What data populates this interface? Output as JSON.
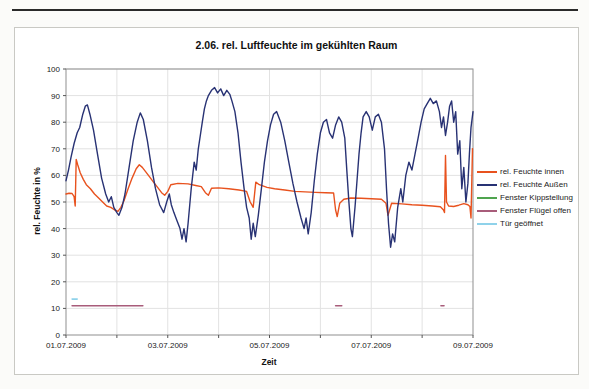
{
  "figure": {
    "top_rule": "divider"
  },
  "chart_data": {
    "type": "line",
    "title": "2.06. rel. Luftfeuchte im gekühlten Raum",
    "xlabel": "Zeit",
    "ylabel": "rel. Feuchte in %",
    "x_unit": "days since 01.07.2009 00:00",
    "xlim": [
      0,
      8
    ],
    "ylim": [
      0,
      100
    ],
    "grid": true,
    "legend_position": "right",
    "x_tick_labels": [
      "01.07.2009",
      "03.07.2009",
      "05.07.2009",
      "07.07.2009",
      "09.07.2009"
    ],
    "x_tick_days": [
      0,
      2,
      4,
      6,
      8
    ],
    "y_tick_labels": [
      "0",
      "10",
      "20",
      "30",
      "40",
      "50",
      "60",
      "70",
      "80",
      "90",
      "100"
    ],
    "y_tick_values": [
      0,
      10,
      20,
      30,
      40,
      50,
      60,
      70,
      80,
      90,
      100
    ],
    "colors": {
      "grid": "#e2e2e2",
      "plot_border": "#8f8f8f",
      "tick": "#555555"
    },
    "series": [
      {
        "name": "rel. Feuchte innen",
        "color": "#e8521e",
        "points": [
          [
            0.0,
            53
          ],
          [
            0.06,
            53.3
          ],
          [
            0.12,
            53.2
          ],
          [
            0.16,
            52
          ],
          [
            0.18,
            48.5
          ],
          [
            0.2,
            66
          ],
          [
            0.23,
            64
          ],
          [
            0.28,
            61
          ],
          [
            0.34,
            58.5
          ],
          [
            0.4,
            56.5
          ],
          [
            0.48,
            55
          ],
          [
            0.56,
            53
          ],
          [
            0.64,
            51.5
          ],
          [
            0.72,
            50
          ],
          [
            0.8,
            48.5
          ],
          [
            0.88,
            48
          ],
          [
            0.96,
            47
          ],
          [
            1.02,
            46.5
          ],
          [
            1.08,
            48
          ],
          [
            1.14,
            50.5
          ],
          [
            1.22,
            55
          ],
          [
            1.3,
            59
          ],
          [
            1.38,
            62.5
          ],
          [
            1.44,
            64
          ],
          [
            1.5,
            63
          ],
          [
            1.56,
            61.5
          ],
          [
            1.64,
            59.5
          ],
          [
            1.72,
            57.5
          ],
          [
            1.8,
            55.5
          ],
          [
            1.88,
            53.5
          ],
          [
            1.94,
            52.5
          ],
          [
            2.0,
            54
          ],
          [
            2.06,
            56.5
          ],
          [
            2.2,
            57
          ],
          [
            2.4,
            56.8
          ],
          [
            2.55,
            56.2
          ],
          [
            2.66,
            55.8
          ],
          [
            2.74,
            53.5
          ],
          [
            2.8,
            52.5
          ],
          [
            2.86,
            55.2
          ],
          [
            3.0,
            55.3
          ],
          [
            3.2,
            55
          ],
          [
            3.4,
            54.5
          ],
          [
            3.55,
            54
          ],
          [
            3.62,
            50
          ],
          [
            3.68,
            48
          ],
          [
            3.73,
            57.5
          ],
          [
            3.8,
            56.5
          ],
          [
            3.95,
            55.5
          ],
          [
            4.1,
            55
          ],
          [
            4.3,
            54.5
          ],
          [
            4.5,
            54
          ],
          [
            4.7,
            53.8
          ],
          [
            4.9,
            53.6
          ],
          [
            5.1,
            53.5
          ],
          [
            5.26,
            53.4
          ],
          [
            5.3,
            47
          ],
          [
            5.33,
            44.5
          ],
          [
            5.38,
            49.5
          ],
          [
            5.46,
            51
          ],
          [
            5.6,
            51.5
          ],
          [
            5.8,
            51.4
          ],
          [
            6.0,
            51.2
          ],
          [
            6.2,
            51
          ],
          [
            6.29,
            49.5
          ],
          [
            6.33,
            45
          ],
          [
            6.4,
            49.5
          ],
          [
            6.6,
            49.3
          ],
          [
            6.8,
            49
          ],
          [
            7.0,
            48.8
          ],
          [
            7.2,
            48.5
          ],
          [
            7.36,
            48.2
          ],
          [
            7.42,
            47
          ],
          [
            7.44,
            46
          ],
          [
            7.46,
            67.5
          ],
          [
            7.48,
            50
          ],
          [
            7.52,
            48.5
          ],
          [
            7.62,
            48.3
          ],
          [
            7.72,
            48.8
          ],
          [
            7.82,
            49.4
          ],
          [
            7.9,
            49
          ],
          [
            7.94,
            48.3
          ],
          [
            7.96,
            44
          ],
          [
            7.99,
            70
          ]
        ]
      },
      {
        "name": "rel. Feuchte Außen",
        "color": "#283274",
        "points": [
          [
            0.0,
            58
          ],
          [
            0.05,
            62
          ],
          [
            0.1,
            67
          ],
          [
            0.16,
            72
          ],
          [
            0.22,
            76
          ],
          [
            0.27,
            78
          ],
          [
            0.33,
            83
          ],
          [
            0.38,
            86
          ],
          [
            0.42,
            86.5
          ],
          [
            0.47,
            83
          ],
          [
            0.54,
            77
          ],
          [
            0.62,
            68
          ],
          [
            0.7,
            59
          ],
          [
            0.78,
            53
          ],
          [
            0.84,
            50
          ],
          [
            0.89,
            52
          ],
          [
            0.94,
            48
          ],
          [
            1.0,
            46
          ],
          [
            1.04,
            45
          ],
          [
            1.1,
            48
          ],
          [
            1.16,
            53
          ],
          [
            1.24,
            63
          ],
          [
            1.32,
            73
          ],
          [
            1.4,
            80
          ],
          [
            1.46,
            83.5
          ],
          [
            1.52,
            81
          ],
          [
            1.6,
            73
          ],
          [
            1.68,
            63
          ],
          [
            1.76,
            55
          ],
          [
            1.84,
            49
          ],
          [
            1.92,
            46
          ],
          [
            1.98,
            50
          ],
          [
            2.03,
            53
          ],
          [
            2.07,
            49
          ],
          [
            2.12,
            46
          ],
          [
            2.18,
            43
          ],
          [
            2.24,
            40
          ],
          [
            2.28,
            36
          ],
          [
            2.32,
            40
          ],
          [
            2.36,
            35
          ],
          [
            2.4,
            42
          ],
          [
            2.46,
            55
          ],
          [
            2.52,
            65
          ],
          [
            2.56,
            62
          ],
          [
            2.6,
            70
          ],
          [
            2.64,
            75
          ],
          [
            2.68,
            80
          ],
          [
            2.72,
            85
          ],
          [
            2.76,
            88
          ],
          [
            2.8,
            90
          ],
          [
            2.86,
            92
          ],
          [
            2.92,
            93
          ],
          [
            2.98,
            91
          ],
          [
            3.04,
            92.5
          ],
          [
            3.1,
            90
          ],
          [
            3.16,
            92
          ],
          [
            3.22,
            90.5
          ],
          [
            3.26,
            88
          ],
          [
            3.32,
            84
          ],
          [
            3.38,
            76
          ],
          [
            3.44,
            65
          ],
          [
            3.5,
            55
          ],
          [
            3.55,
            48
          ],
          [
            3.6,
            44
          ],
          [
            3.64,
            36
          ],
          [
            3.68,
            42
          ],
          [
            3.72,
            37
          ],
          [
            3.78,
            45
          ],
          [
            3.84,
            55
          ],
          [
            3.9,
            65
          ],
          [
            3.96,
            73
          ],
          [
            4.02,
            79
          ],
          [
            4.08,
            83
          ],
          [
            4.14,
            84
          ],
          [
            4.22,
            80
          ],
          [
            4.3,
            73
          ],
          [
            4.38,
            65
          ],
          [
            4.46,
            57
          ],
          [
            4.54,
            50
          ],
          [
            4.62,
            44
          ],
          [
            4.68,
            40
          ],
          [
            4.72,
            44
          ],
          [
            4.76,
            38
          ],
          [
            4.82,
            46
          ],
          [
            4.88,
            58
          ],
          [
            4.94,
            68
          ],
          [
            5.0,
            76
          ],
          [
            5.06,
            80
          ],
          [
            5.12,
            81
          ],
          [
            5.18,
            76
          ],
          [
            5.24,
            74
          ],
          [
            5.3,
            79
          ],
          [
            5.36,
            82
          ],
          [
            5.42,
            80
          ],
          [
            5.48,
            74
          ],
          [
            5.52,
            62
          ],
          [
            5.56,
            50
          ],
          [
            5.6,
            40
          ],
          [
            5.63,
            37
          ],
          [
            5.68,
            48
          ],
          [
            5.72,
            58
          ],
          [
            5.76,
            68
          ],
          [
            5.8,
            76
          ],
          [
            5.84,
            82
          ],
          [
            5.9,
            84
          ],
          [
            5.96,
            82
          ],
          [
            6.02,
            77
          ],
          [
            6.08,
            82
          ],
          [
            6.14,
            83
          ],
          [
            6.2,
            80
          ],
          [
            6.26,
            70
          ],
          [
            6.3,
            55
          ],
          [
            6.34,
            42
          ],
          [
            6.38,
            33
          ],
          [
            6.42,
            38
          ],
          [
            6.46,
            35
          ],
          [
            6.52,
            48
          ],
          [
            6.58,
            55
          ],
          [
            6.62,
            50
          ],
          [
            6.68,
            60
          ],
          [
            6.74,
            65
          ],
          [
            6.8,
            62
          ],
          [
            6.86,
            68
          ],
          [
            6.92,
            74
          ],
          [
            6.98,
            80
          ],
          [
            7.04,
            85
          ],
          [
            7.1,
            87
          ],
          [
            7.16,
            89
          ],
          [
            7.22,
            87
          ],
          [
            7.28,
            88
          ],
          [
            7.34,
            84
          ],
          [
            7.38,
            78
          ],
          [
            7.42,
            82
          ],
          [
            7.46,
            75
          ],
          [
            7.5,
            80
          ],
          [
            7.54,
            86
          ],
          [
            7.58,
            88
          ],
          [
            7.62,
            80
          ],
          [
            7.66,
            84
          ],
          [
            7.7,
            68
          ],
          [
            7.74,
            73
          ],
          [
            7.78,
            55
          ],
          [
            7.82,
            63
          ],
          [
            7.86,
            50
          ],
          [
            7.9,
            57
          ],
          [
            7.93,
            68
          ],
          [
            7.96,
            78
          ],
          [
            8.0,
            84
          ]
        ]
      },
      {
        "name": "Fenster Kippstellung",
        "color": "#4fa44f",
        "segments": []
      },
      {
        "name": "Fenster Flügel offen",
        "color": "#a85c7a",
        "segments": [
          [
            0.12,
            1.51,
            11
          ],
          [
            5.3,
            5.42,
            11
          ],
          [
            7.37,
            7.43,
            11
          ]
        ]
      },
      {
        "name": "Tür geöffnet",
        "color": "#8fd2ea",
        "segments": [
          [
            0.12,
            0.22,
            13.5
          ]
        ]
      }
    ]
  }
}
